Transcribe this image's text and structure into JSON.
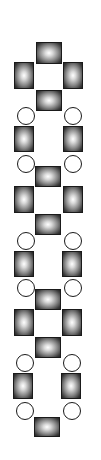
{
  "diagram": {
    "colors": {
      "background": "#ffffff",
      "node_outline": "#1a1a1a",
      "square_center": "#ffffff",
      "square_edge": "#222222",
      "circle_fill": "#ffffff"
    },
    "squares": [
      {
        "x": 36,
        "y": 42,
        "w": 26,
        "h": 22
      },
      {
        "x": 14,
        "y": 62,
        "w": 20,
        "h": 27
      },
      {
        "x": 63,
        "y": 62,
        "w": 20,
        "h": 27
      },
      {
        "x": 36,
        "y": 90,
        "w": 26,
        "h": 21
      },
      {
        "x": 14,
        "y": 126,
        "w": 20,
        "h": 26
      },
      {
        "x": 63,
        "y": 126,
        "w": 20,
        "h": 26
      },
      {
        "x": 35,
        "y": 166,
        "w": 26,
        "h": 21
      },
      {
        "x": 14,
        "y": 186,
        "w": 20,
        "h": 27
      },
      {
        "x": 63,
        "y": 186,
        "w": 20,
        "h": 27
      },
      {
        "x": 35,
        "y": 214,
        "w": 26,
        "h": 21
      },
      {
        "x": 14,
        "y": 251,
        "w": 20,
        "h": 26
      },
      {
        "x": 62,
        "y": 251,
        "w": 20,
        "h": 26
      },
      {
        "x": 35,
        "y": 289,
        "w": 26,
        "h": 21
      },
      {
        "x": 14,
        "y": 309,
        "w": 20,
        "h": 27
      },
      {
        "x": 62,
        "y": 309,
        "w": 20,
        "h": 27
      },
      {
        "x": 35,
        "y": 337,
        "w": 26,
        "h": 21
      },
      {
        "x": 13,
        "y": 373,
        "w": 20,
        "h": 26
      },
      {
        "x": 61,
        "y": 373,
        "w": 20,
        "h": 26
      },
      {
        "x": 34,
        "y": 417,
        "w": 26,
        "h": 20
      }
    ],
    "circles": [
      {
        "x": 17,
        "y": 107,
        "d": 18
      },
      {
        "x": 64,
        "y": 107,
        "d": 18
      },
      {
        "x": 17,
        "y": 155,
        "d": 18
      },
      {
        "x": 64,
        "y": 155,
        "d": 18
      },
      {
        "x": 17,
        "y": 232,
        "d": 18
      },
      {
        "x": 64,
        "y": 232,
        "d": 18
      },
      {
        "x": 17,
        "y": 279,
        "d": 18
      },
      {
        "x": 64,
        "y": 279,
        "d": 18
      },
      {
        "x": 16,
        "y": 354,
        "d": 18
      },
      {
        "x": 63,
        "y": 354,
        "d": 18
      },
      {
        "x": 16,
        "y": 402,
        "d": 18
      },
      {
        "x": 63,
        "y": 402,
        "d": 18
      }
    ]
  }
}
